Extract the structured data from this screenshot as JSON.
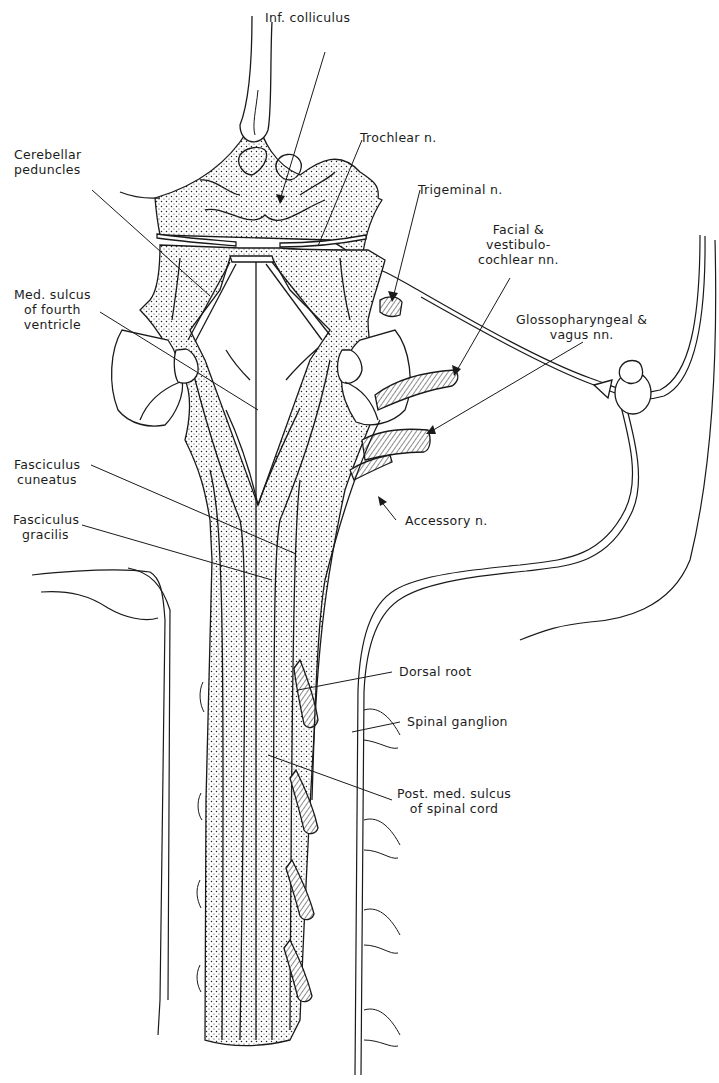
{
  "figure": {
    "ink_color": "#1a1a1a",
    "background": "#ffffff"
  },
  "labels": {
    "inf_colliculus": "Inf. colliculus",
    "trochlear": "Trochlear n.",
    "cerebellar_peduncles": [
      "Cerebellar",
      "peduncles"
    ],
    "trigeminal": "Trigeminal n.",
    "facial_vestibulocochlear": [
      "Facial &",
      "vestibulo-",
      "cochlear nn."
    ],
    "med_sulcus_fourth_ventricle": [
      "Med. sulcus",
      "of fourth",
      "ventricle"
    ],
    "glossopharyngeal_vagus": [
      "Glossopharyngeal &",
      "vagus nn."
    ],
    "fasciculus_cuneatus": [
      "Fasciculus",
      "cuneatus"
    ],
    "accessory": "Accessory n.",
    "fasciculus_gracilis": [
      "Fasciculus",
      "gracilis"
    ],
    "dorsal_root": "Dorsal root",
    "spinal_ganglion": "Spinal ganglion",
    "post_med_sulcus_spinal_cord": [
      "Post. med. sulcus",
      "of spinal cord"
    ]
  }
}
